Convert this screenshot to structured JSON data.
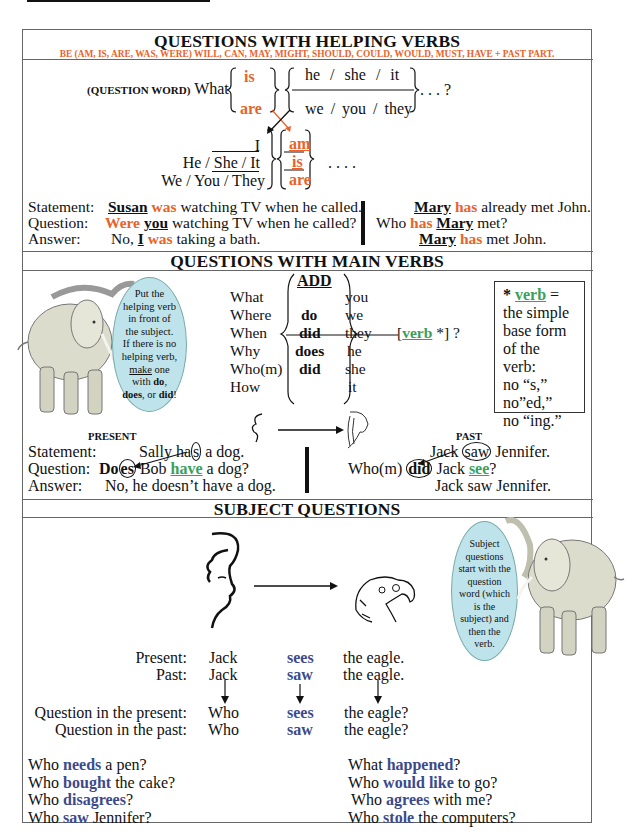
{
  "colors": {
    "orange": "#e8632b",
    "green": "#3aa05a",
    "blue": "#3c4a8c",
    "bubble": "#bfe3ea"
  },
  "section1": {
    "title": "QUESTIONS WITH HELPING VERBS",
    "subtitle": "BE (AM, IS, ARE, WAS, WERE) WILL, CAN, MAY, MIGHT, SHOULD, COULD, WOULD, MUST, HAVE + PAST PART.",
    "question_word_label": "(QUESTION WORD)",
    "what": "What",
    "verbs_top": [
      "is",
      "are"
    ],
    "subjects_top": [
      "he  /  she  /  it",
      "we  /  you  /  they"
    ],
    "ellipsis_q": ". . . ?",
    "subjects_bottom": [
      "I",
      "He / She / It",
      "We / You / They"
    ],
    "verbs_bottom": [
      "am",
      "is",
      "are"
    ],
    "ellipsis": ". . . .",
    "examples": {
      "labels": [
        "Statement:",
        "Question:",
        "Answer:"
      ],
      "left": [
        {
          "parts": [
            "Susan",
            " ",
            "was",
            " watching TV when he called."
          ]
        },
        {
          "parts": [
            "Were",
            " ",
            "you",
            " watching TV when he called?"
          ]
        },
        {
          "parts": [
            "No, ",
            "I",
            " ",
            "was",
            " taking a bath."
          ]
        }
      ],
      "right": [
        {
          "parts": [
            "Mary",
            " ",
            "has",
            " already met John."
          ]
        },
        {
          "parts": [
            "Who ",
            "has",
            " ",
            "Mary",
            " met?"
          ]
        },
        {
          "parts": [
            "Mary",
            " ",
            "has",
            " met John."
          ]
        }
      ]
    }
  },
  "section2": {
    "title": "QUESTIONS WITH MAIN VERBS",
    "bubble_text": [
      "Put the",
      "helping verb",
      "in front of",
      "the subject.",
      "If there is no",
      "helping verb,",
      "make",
      " one",
      "with ",
      "do",
      ",",
      "does",
      ", or ",
      "did",
      "!"
    ],
    "question_words": [
      "What",
      "Where",
      "When",
      "Why",
      "Who(m)",
      "How"
    ],
    "add_label": "ADD",
    "aux": [
      "do",
      "did",
      "does",
      "did"
    ],
    "pronouns": [
      "you",
      "we",
      "they",
      "he",
      "she",
      "it"
    ],
    "verb_slot": {
      "open": "[",
      "verb": "verb",
      "rest": " *] ?"
    },
    "note": {
      "star": "* ",
      "verb": "verb",
      "eq": " =",
      "lines": [
        "the simple",
        "base form",
        "of the verb:",
        "no “s,”",
        "no”ed,”",
        "no “ing.”"
      ]
    },
    "present_label": "PRESENT",
    "past_label": "PAST",
    "labels": [
      "Statement:",
      "Question:",
      "Answer:"
    ],
    "present": {
      "statement": {
        "a": "Sally ha",
        "b": "s",
        "c": " a dog."
      },
      "question": {
        "a": "Do",
        "b": "es",
        "c": " Bob ",
        "d": "have",
        "e": " a dog?"
      },
      "answer": "No, he doesn’t have a dog."
    },
    "past": {
      "statement": {
        "a": "Jack ",
        "b": "saw",
        "c": " Jennifer."
      },
      "question": {
        "a": "Who(m) ",
        "b": "did",
        "c": " Jack ",
        "d": "see",
        "e": "?"
      },
      "answer": "Jack saw Jennifer."
    }
  },
  "section3": {
    "title": "SUBJECT QUESTIONS",
    "bubble_lines": [
      "Subject",
      "questions",
      "start with the",
      "question",
      "word (which",
      "is the",
      "subject) and",
      "then the",
      "verb."
    ],
    "table": [
      {
        "label": "Present:",
        "subject": "Jack",
        "verb": "sees",
        "object": "the eagle."
      },
      {
        "label": "Past:",
        "subject": "Jack",
        "verb": "saw",
        "object": "the eagle."
      },
      {
        "label": "Question in the present:",
        "subject": "Who",
        "verb": "sees",
        "object": "the eagle?"
      },
      {
        "label": "Question in the past:",
        "subject": "Who",
        "verb": "saw",
        "object": "the eagle?"
      }
    ],
    "left_examples": [
      {
        "a": "Who ",
        "v": "needs",
        "c": " a pen?"
      },
      {
        "a": "Who ",
        "v": "bought",
        "c": " the cake?"
      },
      {
        "a": "Who ",
        "v": "disagrees",
        "c": "?"
      },
      {
        "a": "Who ",
        "v": "saw",
        "c": " Jennifer?"
      }
    ],
    "right_examples": [
      {
        "a": "What ",
        "v": "happened",
        "c": "?"
      },
      {
        "a": "Who ",
        "v": "would like",
        "c": " to go?"
      },
      {
        "a": "Who ",
        "v": "agrees",
        "c": " with me?"
      },
      {
        "a": "Who ",
        "v": "stole",
        "c": " the computers?"
      }
    ]
  }
}
